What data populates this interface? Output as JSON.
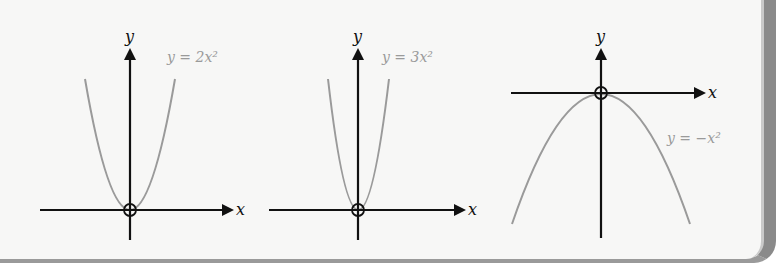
{
  "graphs": [
    {
      "id": "graph-1",
      "equation": "y = 2x²",
      "x_axis_label": "x",
      "y_axis_label": "y",
      "curve": "upward parabola, coefficient 2"
    },
    {
      "id": "graph-2",
      "equation": "y = 3x²",
      "x_axis_label": "x",
      "y_axis_label": "y",
      "curve": "upward parabola, coefficient 3"
    },
    {
      "id": "graph-3",
      "equation": "y = −x²",
      "x_axis_label": "x",
      "y_axis_label": "y",
      "curve": "downward parabola, coefficient -1"
    }
  ],
  "colors": {
    "axis": "#111111",
    "curve": "#9a9a9a",
    "equation_text": "#9a9a9a",
    "background": "#f7f7f6",
    "frame": "#8a8a8a"
  }
}
